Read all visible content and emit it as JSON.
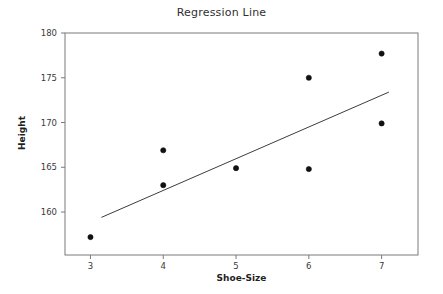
{
  "chart_data": {
    "type": "scatter",
    "title": "Regression Line",
    "xlabel": "Shoe-Size",
    "ylabel": "Height",
    "grid": false,
    "legend": "none",
    "xlim": [
      2.65,
      7.5
    ],
    "ylim": [
      155.2,
      180.0
    ],
    "xticks": [
      3,
      4,
      5,
      6,
      7
    ],
    "xtick_labels": [
      "3",
      "4",
      "5",
      "6",
      "7"
    ],
    "yticks": [
      160,
      165,
      170,
      175,
      180
    ],
    "ytick_labels": [
      "160",
      "165",
      "170",
      "175",
      "180"
    ],
    "points": [
      {
        "x": 3,
        "y": 157.2
      },
      {
        "x": 4,
        "y": 163.0
      },
      {
        "x": 4,
        "y": 166.9
      },
      {
        "x": 5,
        "y": 164.9
      },
      {
        "x": 6,
        "y": 164.8
      },
      {
        "x": 6,
        "y": 175.0
      },
      {
        "x": 7,
        "y": 169.9
      },
      {
        "x": 7,
        "y": 177.7
      }
    ],
    "series": [
      {
        "name": "Observations",
        "type": "scatter",
        "marker": "circle",
        "marker_color": "#111111",
        "marker_size": 4,
        "x": [
          3,
          4,
          4,
          5,
          6,
          6,
          7,
          7
        ],
        "values": [
          157.2,
          163.0,
          166.9,
          164.9,
          164.8,
          175.0,
          169.9,
          177.7
        ]
      },
      {
        "name": "Regression Line",
        "type": "line",
        "line_color": "#3d3d3d",
        "line_width": 1,
        "x": [
          3.15,
          7.1
        ],
        "values": [
          159.4,
          173.4
        ],
        "slope": 3.54,
        "intercept": 148.3
      }
    ],
    "axes_color": "#7a7a7a",
    "background": "#ffffff"
  },
  "figure": {
    "title": "Regression Line",
    "x_axis_title": "Shoe-Size",
    "y_axis_title": "Height"
  }
}
